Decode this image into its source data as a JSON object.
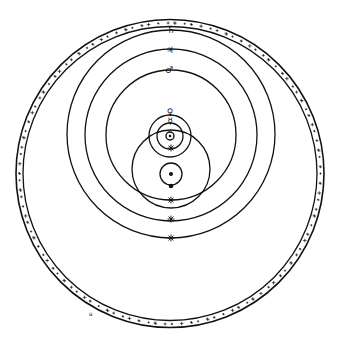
{
  "diagram": {
    "ink_color": "#111111",
    "background": "#ffffff",
    "fixed_stars_band": {
      "cx": 170,
      "cy": 173.5,
      "r_outer": 154,
      "r_inner": 147
    },
    "orbits": [
      {
        "name": "saturn-orbit",
        "cx": 171,
        "cy": 134,
        "r": 104,
        "symbol": "♄",
        "sx": 171,
        "sy": 30
      },
      {
        "name": "jupiter-orbit",
        "cx": 171,
        "cy": 135,
        "r": 86,
        "symbol": "♃",
        "sx": 170,
        "sy": 50
      },
      {
        "name": "mars-orbit",
        "cx": 171,
        "cy": 135,
        "r": 65,
        "symbol": "♂",
        "sx": 169,
        "sy": 70
      },
      {
        "name": "sun-orbit",
        "cx": 171,
        "cy": 169,
        "r": 39
      },
      {
        "name": "venus-orbit",
        "cx": 170,
        "cy": 136,
        "r": 21,
        "symbol": "♀",
        "sx": 170,
        "sy": 112
      },
      {
        "name": "mercury-orbit",
        "cx": 170,
        "cy": 136,
        "r": 13,
        "symbol": "☿",
        "sx": 170,
        "sy": 121
      },
      {
        "name": "moon-orbit",
        "cx": 171,
        "cy": 174,
        "r": 11
      }
    ],
    "bodies": {
      "sun": {
        "x": 170,
        "y": 136,
        "symbol": "☉"
      },
      "earth": {
        "x": 171,
        "y": 174
      },
      "moon": {
        "x": 171,
        "y": 186
      }
    },
    "star_markers": [
      {
        "x": 171,
        "y": 148
      },
      {
        "x": 171,
        "y": 200
      },
      {
        "x": 171,
        "y": 219
      },
      {
        "x": 171,
        "y": 238
      }
    ],
    "corner_mark": {
      "x": 89,
      "y": 316,
      "text": "a"
    }
  }
}
